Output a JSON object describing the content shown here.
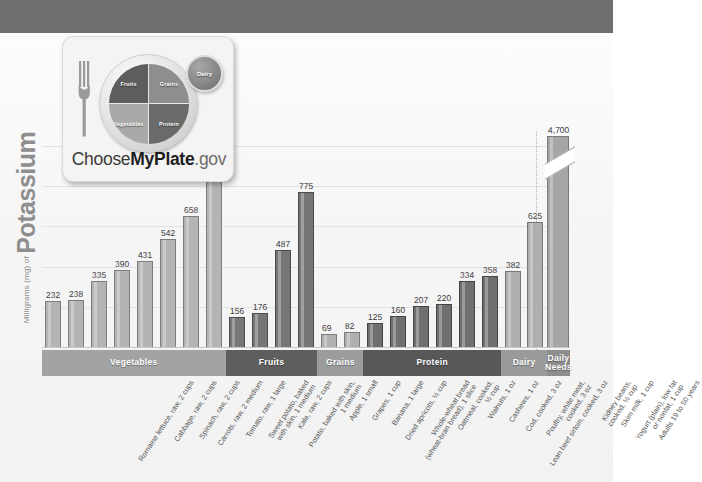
{
  "logo": {
    "name": "myplate-logo",
    "wordmark_prefix": "Choose",
    "wordmark_bold": "MyPlate",
    "wordmark_suffix": ".gov",
    "plate_sections": [
      {
        "key": "fruits",
        "label": "Fruits"
      },
      {
        "key": "grains",
        "label": "Grains"
      },
      {
        "key": "vegetables",
        "label": "Vegetables"
      },
      {
        "key": "protein",
        "label": "Protein"
      }
    ],
    "dairy_label": "Dairy"
  },
  "axis": {
    "y_unit": "Milligrams (mg) of ",
    "y_main": "Potassium"
  },
  "chart_data": {
    "type": "bar",
    "title": "",
    "xlabel": "",
    "ylabel": "Milligrams (mg) of Potassium",
    "ylim": [
      0,
      1100
    ],
    "grid": true,
    "gridlines": [
      0,
      200,
      400,
      600,
      800,
      1000
    ],
    "legend": "none",
    "categories": [
      "Romaine lettuce, raw, 2 cups",
      "Cabbage, raw, 2 cups",
      "Spinach, raw, 2 cups",
      "Carrots, raw, 2 medium",
      "Tomato, raw, 1 large",
      "Sweet potato, baked with skin, 1 medium",
      "Kale, raw, 2 cups",
      "Potato, baked with skin, 1 medium",
      "Apple, 1 small",
      "Grapes, 1 cup",
      "Banana, 1 large",
      "Dried apricots, ½ cup",
      "Whole-wheat bread (wheat-bran bread), 1 slice",
      "Oatmeal, cooked, ½ cup",
      "Walnuts, 1 oz",
      "Cashews, 1 oz",
      "Cod, cooked, 3 oz",
      "Poultry, white meat, cooked, 3 oz",
      "Lean beef sirloin, cooked, 3 oz",
      "Kidney beans, cooked, ½ cup",
      "Skim milk, 1 cup",
      "Yogurt (plain), low fat or nonfat, 1 cup",
      "Adults 19 to 50 years"
    ],
    "values": [
      232,
      238,
      335,
      390,
      431,
      542,
      658,
      926,
      156,
      176,
      487,
      775,
      69,
      82,
      125,
      160,
      207,
      220,
      334,
      358,
      382,
      625,
      4700
    ],
    "value_labels": [
      "232",
      "238",
      "335",
      "390",
      "431",
      "542",
      "658",
      "926",
      "156",
      "176",
      "487",
      "775",
      "69",
      "82",
      "125",
      "160",
      "207",
      "220",
      "334",
      "358",
      "382",
      "625",
      "4,700"
    ],
    "groups": [
      {
        "label": "Vegetables",
        "key": "vegetables",
        "count": 8
      },
      {
        "label": "Fruits",
        "key": "fruits",
        "count": 4
      },
      {
        "label": "Grains",
        "key": "grains",
        "count": 2
      },
      {
        "label": "Protein",
        "key": "protein",
        "count": 6
      },
      {
        "label": "Dairy",
        "key": "dairy",
        "count": 2
      },
      {
        "label": "Daily\nNeeds",
        "key": "daily",
        "count": 1
      }
    ],
    "axis_break": {
      "on_series_index": 22,
      "note": "bar truncated; value 4,700 exceeds axis scale"
    }
  },
  "colors": {
    "header_band": "#6e6e6e",
    "vegetables": "#b4b4b4",
    "fruits": "#767676",
    "grains": "#b0b0b0",
    "protein": "#6f6f6f",
    "dairy": "#aeaeae",
    "daily_needs": "#a6a6a6",
    "gridline": "#e2e2e2",
    "value_text": "#3b3b3b"
  }
}
